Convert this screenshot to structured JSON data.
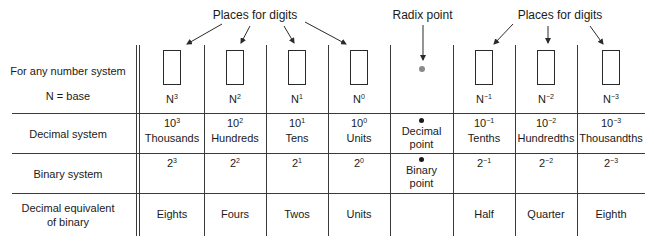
{
  "callouts": {
    "places_left": "Places for digits",
    "radix": "Radix point",
    "places_right": "Places for digits"
  },
  "row_labels": {
    "any_system_line1": "For any number system",
    "any_system_line2": "N = base",
    "decimal": "Decimal system",
    "binary": "Binary system",
    "decimal_equiv_line1": "Decimal equivalent",
    "decimal_equiv_line2": "of binary"
  },
  "columns": [
    {
      "base": "N",
      "exp": "3",
      "dec_base": "10",
      "dec_exp": "3",
      "dec_name": "Thousands",
      "bin_base": "2",
      "bin_exp": "3",
      "equiv": "Eights"
    },
    {
      "base": "N",
      "exp": "2",
      "dec_base": "10",
      "dec_exp": "2",
      "dec_name": "Hundreds",
      "bin_base": "2",
      "bin_exp": "2",
      "equiv": "Fours"
    },
    {
      "base": "N",
      "exp": "1",
      "dec_base": "10",
      "dec_exp": "1",
      "dec_name": "Tens",
      "bin_base": "2",
      "bin_exp": "1",
      "equiv": "Twos"
    },
    {
      "base": "N",
      "exp": "0",
      "dec_base": "10",
      "dec_exp": "0",
      "dec_name": "Units",
      "bin_base": "2",
      "bin_exp": "0",
      "equiv": "Units"
    },
    {
      "radix": true,
      "dec_point_line1": "Decimal",
      "dec_point_line2": "point",
      "bin_point_line1": "Binary",
      "bin_point_line2": "point",
      "equiv": ""
    },
    {
      "base": "N",
      "exp": "−1",
      "dec_base": "10",
      "dec_exp": "−1",
      "dec_name": "Tenths",
      "bin_base": "2",
      "bin_exp": "−1",
      "equiv": "Half"
    },
    {
      "base": "N",
      "exp": "−2",
      "dec_base": "10",
      "dec_exp": "−2",
      "dec_name": "Hundredths",
      "bin_base": "2",
      "bin_exp": "−2",
      "equiv": "Quarter"
    },
    {
      "base": "N",
      "exp": "−3",
      "dec_base": "10",
      "dec_exp": "−3",
      "dec_name": "Thousandths",
      "bin_base": "2",
      "bin_exp": "−3",
      "equiv": "Eighth"
    }
  ],
  "colors": {
    "line": "#3a3a3a",
    "radix_dot": "#8a8a8a",
    "point_dot": "#1a1a1a"
  }
}
